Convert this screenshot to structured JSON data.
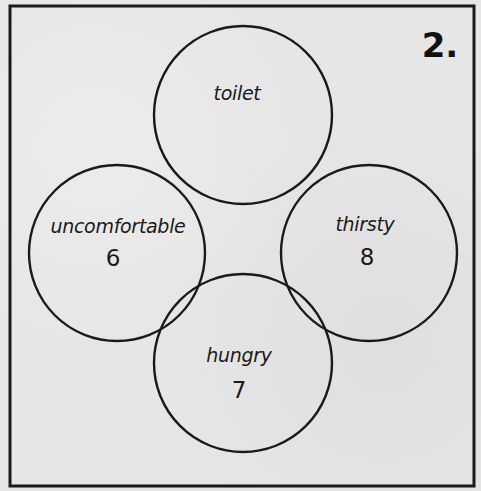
{
  "panel": {
    "number_label": "2.",
    "border_color": "#1a1a1a",
    "background_color": "#e6e6e6"
  },
  "circles": [
    {
      "id": "top",
      "label": "toilet",
      "value": null
    },
    {
      "id": "left",
      "label": "uncomfortable",
      "value": "6"
    },
    {
      "id": "right",
      "label": "thirsty",
      "value": "8"
    },
    {
      "id": "bottom",
      "label": "hungry",
      "value": "7"
    }
  ],
  "diagram": {
    "type": "four-circle arrangement",
    "nodes": [
      {
        "position": "top",
        "label": "toilet"
      },
      {
        "position": "left",
        "label": "uncomfortable",
        "number": 6
      },
      {
        "position": "right",
        "label": "thirsty",
        "number": 8
      },
      {
        "position": "bottom",
        "label": "hungry",
        "number": 7
      }
    ]
  }
}
